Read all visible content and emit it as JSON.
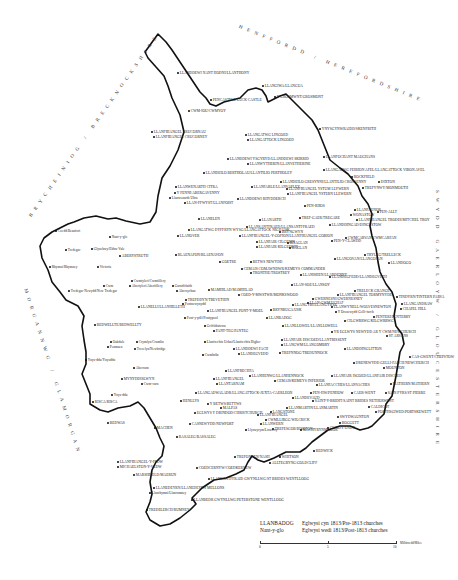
{
  "regions": {
    "brecknock": "BRYCHEINIOG / BRECKNOCKSHIRE",
    "hereford": "HENFFORDD / HEREFORDSHIRE",
    "gloucester": "SWYDD GAERLOYW / GLOUCESTERSHIRE",
    "glamorgan": "MORGANNWG / GLAMORGAN"
  },
  "places": [
    {
      "name": "LLANDDEWI NANT HODNI/LLANTHONY",
      "x": 176,
      "y": 71,
      "type": "pre"
    },
    {
      "name": "PENCASTELL/LUCK CASTLE",
      "x": 209,
      "y": 98,
      "type": "pre"
    },
    {
      "name": "CWM-IOU/CWMYOY",
      "x": 187,
      "y": 109,
      "type": "pre"
    },
    {
      "name": "LLANGIWA/LLANGUA",
      "x": 261,
      "y": 84,
      "type": "pre"
    },
    {
      "name": "Y GROSMWNT/GROSMONT",
      "x": 273,
      "y": 95,
      "type": "pre"
    },
    {
      "name": "LLANFIHANGEL CRUCORNAU",
      "x": 150,
      "y": 130,
      "type": "pre"
    },
    {
      "name": "LLANFIHANGEL CRUCORNEY",
      "x": 152,
      "y": 135,
      "type": "pre"
    },
    {
      "name": "LLANGATWG LINGOED",
      "x": 244,
      "y": 133,
      "type": "pre"
    },
    {
      "name": "LLANGATTOCK LINGOED",
      "x": 246,
      "y": 138,
      "type": "pre"
    },
    {
      "name": "YNYSGYNWRAIDD/SKENFRITH",
      "x": 318,
      "y": 127,
      "type": "pre"
    },
    {
      "name": "LLANDDEWI YSGYRYD/LLANDDEWI SKIRRID",
      "x": 226,
      "y": 157,
      "type": "pre"
    },
    {
      "name": "LLANWYTHERIN/LLANVETHERINE",
      "x": 246,
      "y": 162,
      "type": "pre"
    },
    {
      "name": "LLANFOCHANT MAUGHANS",
      "x": 322,
      "y": 155,
      "type": "pre"
    },
    {
      "name": "LLANDEILO BERTHOLAU/LLANTILIO PERTHOLEY",
      "x": 202,
      "y": 171,
      "type": "pre"
    },
    {
      "name": "LLANGATWG FEIBION AFEL/LLANGATTOCK VIBON AVEL",
      "x": 322,
      "y": 168,
      "type": "pre"
    },
    {
      "name": "LLANDEILO GRESYNNI/LLANTILIO CROSSENNY",
      "x": 279,
      "y": 180,
      "type": "pre"
    },
    {
      "name": "ROCKFIELD",
      "x": 350,
      "y": 175,
      "type": "pre"
    },
    {
      "name": "DIXTON",
      "x": 377,
      "y": 180,
      "type": "pre"
    },
    {
      "name": "LLANFABLE/LLANVAPLEY",
      "x": 250,
      "y": 185,
      "type": "pre"
    },
    {
      "name": "LLANFIHANGEL YSTUM LLYWERN",
      "x": 285,
      "y": 187,
      "type": "pre"
    },
    {
      "name": "LLANFIHANGEL YSTERN LLEWERN",
      "x": 286,
      "y": 192,
      "type": "pre"
    },
    {
      "name": "TREFYNWY/MONMOUTH",
      "x": 361,
      "y": 186,
      "type": "pre"
    },
    {
      "name": "LLANWENARTH CITRA",
      "x": 174,
      "y": 185,
      "type": "pre"
    },
    {
      "name": "Y FENNI/ABERGAVENNY",
      "x": 173,
      "y": 191,
      "type": "pre"
    },
    {
      "name": "Llanwenarth Ultra",
      "x": 168,
      "y": 196,
      "type": "post"
    },
    {
      "name": "LLANDDEWI RHYDDERCH",
      "x": 236,
      "y": 197,
      "type": "pre"
    },
    {
      "name": "LLAN-FFWYST/LLANFOIST",
      "x": 183,
      "y": 201,
      "type": "pre"
    },
    {
      "name": "PEN-RHOS",
      "x": 303,
      "y": 204,
      "type": "pre"
    },
    {
      "name": "LLANFAENOR",
      "x": 353,
      "y": 208,
      "type": "pre"
    },
    {
      "name": "WONASTOW",
      "x": 349,
      "y": 213,
      "type": "pre"
    },
    {
      "name": "PEN-ALLT",
      "x": 376,
      "y": 210,
      "type": "pre"
    },
    {
      "name": "LLANFIHANGEL TRODDI/MITCHEL TROY",
      "x": 355,
      "y": 218,
      "type": "pre"
    },
    {
      "name": "LLANDDINGAD/DINGESTOW",
      "x": 328,
      "y": 223,
      "type": "pre"
    },
    {
      "name": "LLANELEN",
      "x": 197,
      "y": 217,
      "type": "pre"
    },
    {
      "name": "LLANARTH",
      "x": 258,
      "y": 218,
      "type": "pre"
    },
    {
      "name": "TREF-GAER/TREGARE",
      "x": 298,
      "y": 216,
      "type": "pre"
    },
    {
      "name": "LLANGATWG DYFFRYN WYSG/LLANGATTOCK NIGH USK",
      "x": 187,
      "y": 228,
      "type": "pre"
    },
    {
      "name": "LLANSANTFRAED/LLANSANTFFRAED",
      "x": 245,
      "y": 225,
      "type": "pre"
    },
    {
      "name": "BRYNGWYN",
      "x": 278,
      "y": 230,
      "type": "pre"
    },
    {
      "name": "LLANFIHANGEL-Y-GOFION/LLANFIHANGEL GOBION",
      "x": 238,
      "y": 234,
      "type": "pre"
    },
    {
      "name": "LLANOVER",
      "x": 176,
      "y": 234,
      "type": "pre"
    },
    {
      "name": "Nant-y-glo",
      "x": 108,
      "y": 235,
      "type": "post"
    },
    {
      "name": "Coedd/Beaufort",
      "x": 54,
      "y": 229,
      "type": "post"
    },
    {
      "name": "LLANFAIR CILGEDIN",
      "x": 255,
      "y": 240,
      "type": "pre"
    },
    {
      "name": "LLANFAIR KILGEDDIN",
      "x": 255,
      "y": 245,
      "type": "pre"
    },
    {
      "name": "RHAGLAN",
      "x": 286,
      "y": 241,
      "type": "pre"
    },
    {
      "name": "RAGLAN",
      "x": 288,
      "y": 246,
      "type": "pre"
    },
    {
      "name": "PEN-Y-CLAWDD",
      "x": 330,
      "y": 239,
      "type": "pre"
    },
    {
      "name": "CWMCARVAN/CWMCARFAN",
      "x": 344,
      "y": 236,
      "type": "pre"
    },
    {
      "name": "Tredegar",
      "x": 64,
      "y": 248,
      "type": "post"
    },
    {
      "name": "Glynebwy/Ebbw Vale",
      "x": 90,
      "y": 247,
      "type": "post"
    },
    {
      "name": "ABERYSTRUTH",
      "x": 118,
      "y": 254,
      "type": "pre"
    },
    {
      "name": "BLAENAFON/BLAENAVON",
      "x": 174,
      "y": 253,
      "type": "pre"
    },
    {
      "name": "TRYLEG/TRELLECK",
      "x": 363,
      "y": 253,
      "type": "pre"
    },
    {
      "name": "LLANGOVAN/LLANGOFAN",
      "x": 333,
      "y": 257,
      "type": "pre"
    },
    {
      "name": "LLANDOGO",
      "x": 387,
      "y": 261,
      "type": "pre"
    },
    {
      "name": "Rhymni/Rhymney",
      "x": 48,
      "y": 265,
      "type": "post"
    },
    {
      "name": "Victoria",
      "x": 96,
      "y": 265,
      "type": "post"
    },
    {
      "name": "GOETRE",
      "x": 218,
      "y": 260,
      "type": "pre"
    },
    {
      "name": "BETWS NEWYDD",
      "x": 249,
      "y": 260,
      "type": "pre"
    },
    {
      "name": "CEMAIS COMAWNDWR/KEMEYS COMMANDER",
      "x": 240,
      "y": 267,
      "type": "pre"
    },
    {
      "name": "TRONTHE/TROSTREY",
      "x": 249,
      "y": 271,
      "type": "pre"
    },
    {
      "name": "LLANISHEN/LLANDENNY",
      "x": 299,
      "y": 273,
      "type": "pre"
    },
    {
      "name": "Cwmtyleri/Cwmtillery",
      "x": 130,
      "y": 279,
      "type": "post"
    },
    {
      "name": "Abertyleri/Abertillery",
      "x": 128,
      "y": 284,
      "type": "post"
    },
    {
      "name": "Garndiffaith",
      "x": 171,
      "y": 284,
      "type": "post"
    },
    {
      "name": "Abersychan",
      "x": 175,
      "y": 289,
      "type": "post"
    },
    {
      "name": "Cwm",
      "x": 102,
      "y": 284,
      "type": "post"
    },
    {
      "name": "Tredegar Newydd/New Tredegar",
      "x": 67,
      "y": 289,
      "type": "post"
    },
    {
      "name": "MAMHILAD/MAMHILAD",
      "x": 207,
      "y": 288,
      "type": "pre"
    },
    {
      "name": "COED-Y-MWSTWR/MONKSWOOD",
      "x": 237,
      "y": 293,
      "type": "pre"
    },
    {
      "name": "LLAN-SOE/LLANSOY",
      "x": 290,
      "y": 283,
      "type": "pre"
    },
    {
      "name": "LLANDEGFEDD/LLANDEGVETH",
      "x": 328,
      "y": 275,
      "type": "pre"
    },
    {
      "name": "TRELECK GRANGE",
      "x": 353,
      "y": 289,
      "type": "pre"
    },
    {
      "name": "LLANFIHANGEL TORMYNYDD",
      "x": 336,
      "y": 293,
      "type": "pre"
    },
    {
      "name": "TINDYRN/TINTERN PARVA",
      "x": 395,
      "y": 295,
      "type": "pre"
    },
    {
      "name": "GWERNESNI/GWERNESNEY",
      "x": 311,
      "y": 297,
      "type": "pre"
    },
    {
      "name": "LLANGANDRAW",
      "x": 400,
      "y": 302,
      "type": "pre"
    },
    {
      "name": "CHAPEL HILL",
      "x": 399,
      "y": 307,
      "type": "pre"
    },
    {
      "name": "TREFDDYN/TREVETHIN",
      "x": 184,
      "y": 298,
      "type": "pre"
    },
    {
      "name": "Pontnewynydd",
      "x": 181,
      "y": 302,
      "type": "post"
    },
    {
      "name": "LLANELLI/LLANHILLETH",
      "x": 137,
      "y": 305,
      "type": "pre"
    },
    {
      "name": "LLANGYBI/LLANGYBYE",
      "x": 291,
      "y": 303,
      "type": "pre"
    },
    {
      "name": "LLAN-GWM UCHAF",
      "x": 306,
      "y": 301,
      "type": "pre"
    },
    {
      "name": "LLANFIHANGEL PONT-Y-MOEL",
      "x": 206,
      "y": 309,
      "type": "pre"
    },
    {
      "name": "BRYNBUGA/USK",
      "x": 269,
      "y": 308,
      "type": "pre"
    },
    {
      "name": "LLANWYNELL/WOLVESNEWTON",
      "x": 330,
      "y": 305,
      "type": "pre"
    },
    {
      "name": "Y Drenewydd Gelli-farch",
      "x": 334,
      "y": 310,
      "type": "post"
    },
    {
      "name": "PENTERI/PENTERRY",
      "x": 372,
      "y": 315,
      "type": "pre"
    },
    {
      "name": "Pont-y-pŵl/Pontypool",
      "x": 183,
      "y": 316,
      "type": "post"
    },
    {
      "name": "LLANBADOG",
      "x": 265,
      "y": 316,
      "type": "pre"
    },
    {
      "name": "BEDWELLTE/BEDWELLTY",
      "x": 93,
      "y": 323,
      "type": "pre"
    },
    {
      "name": "Griffithstown",
      "x": 203,
      "y": 324,
      "type": "post"
    },
    {
      "name": "PANT-TEG/PANTEG",
      "x": 212,
      "y": 329,
      "type": "pre"
    },
    {
      "name": "LLANLLOWEL/LLANLLOWELL",
      "x": 281,
      "y": 324,
      "type": "pre"
    },
    {
      "name": "CILGWRRWG/KILGWRRWG",
      "x": 343,
      "y": 319,
      "type": "pre"
    },
    {
      "name": "YR EGLWYS NEWYDD AR Y CWM/NEWCHURCH",
      "x": 330,
      "y": 330,
      "type": "pre"
    },
    {
      "name": "ST ARVANS",
      "x": 385,
      "y": 334,
      "type": "pre"
    },
    {
      "name": "LLANFAIR DISCOED/LLANTRISSENT",
      "x": 280,
      "y": 338,
      "type": "pre"
    },
    {
      "name": "LLANGWM/LLANGOMBRY",
      "x": 280,
      "y": 343,
      "type": "pre"
    },
    {
      "name": "Oakdale",
      "x": 109,
      "y": 340,
      "type": "post"
    },
    {
      "name": "Penmaen",
      "x": 106,
      "y": 345,
      "type": "post"
    },
    {
      "name": "Crymlyn/Crumlin",
      "x": 135,
      "y": 340,
      "type": "post"
    },
    {
      "name": "Trecelyn/Newbridge",
      "x": 133,
      "y": 347,
      "type": "post"
    },
    {
      "name": "Llanfrechfa Uchaf/Llanfrechfa Higher",
      "x": 203,
      "y": 340,
      "type": "post"
    },
    {
      "name": "LLANDDEWI FACH",
      "x": 232,
      "y": 347,
      "type": "pre"
    },
    {
      "name": "LLANDEGVEDD",
      "x": 237,
      "y": 352,
      "type": "pre"
    },
    {
      "name": "TREFNNOG/TREDUNNOCK",
      "x": 278,
      "y": 351,
      "type": "pre"
    },
    {
      "name": "LLANDDINGLITTON",
      "x": 343,
      "y": 347,
      "type": "pre"
    },
    {
      "name": "CAS-GWENT/CHEPSTOW",
      "x": 408,
      "y": 355,
      "type": "pre"
    },
    {
      "name": "Ynys-ddu/Ynysddu",
      "x": 84,
      "y": 358,
      "type": "post"
    },
    {
      "name": "Cwmbrân",
      "x": 201,
      "y": 353,
      "type": "post"
    },
    {
      "name": "DRENEWYDD GELLI-FARCH/NEWCHURCH",
      "x": 352,
      "y": 361,
      "type": "pre"
    },
    {
      "name": "MOUNTON",
      "x": 382,
      "y": 366,
      "type": "pre"
    },
    {
      "name": "Abercarn",
      "x": 132,
      "y": 366,
      "type": "post"
    },
    {
      "name": "LLANFRECHFA",
      "x": 224,
      "y": 369,
      "type": "pre"
    },
    {
      "name": "LLANHENWG/LLANHENNOCK",
      "x": 248,
      "y": 374,
      "type": "pre"
    },
    {
      "name": "LLANFAIR ISGOED/LLANFAIR DISCOED",
      "x": 330,
      "y": 374,
      "type": "pre"
    },
    {
      "name": "MATHERN/MATHERN",
      "x": 389,
      "y": 382,
      "type": "pre"
    },
    {
      "name": "MYNYDDISLWYN",
      "x": 120,
      "y": 377,
      "type": "pre"
    },
    {
      "name": "Cwm-carn",
      "x": 140,
      "y": 382,
      "type": "post"
    },
    {
      "name": "LLANFIHANGEL",
      "x": 212,
      "y": 377,
      "type": "pre"
    },
    {
      "name": "LLANTARNAM",
      "x": 215,
      "y": 382,
      "type": "pre"
    },
    {
      "name": "CEMAIS/KEMEYS INFERIOR",
      "x": 273,
      "y": 379,
      "type": "pre"
    },
    {
      "name": "LLANFACCHES/LLANVACHES",
      "x": 315,
      "y": 383,
      "type": "pre"
    },
    {
      "name": "PEN-HW/PENHOW",
      "x": 309,
      "y": 391,
      "type": "pre"
    },
    {
      "name": "CAER-WENT",
      "x": 350,
      "y": 391,
      "type": "pre"
    },
    {
      "name": "SAIN PYRS/ST PIERRE",
      "x": 384,
      "y": 391,
      "type": "pre"
    },
    {
      "name": "Ynys-ddu",
      "x": 110,
      "y": 393,
      "type": "post"
    },
    {
      "name": "LLANGADWALADR/LLANGATTOCK-JUXTA-CAERLEON",
      "x": 194,
      "y": 391,
      "type": "pre"
    },
    {
      "name": "LLANDEVAUD",
      "x": 291,
      "y": 396,
      "type": "pre"
    },
    {
      "name": "SAINT-Y-BRIDIT/SAINT BRIDES NETHERWENT",
      "x": 311,
      "y": 399,
      "type": "pre"
    },
    {
      "name": "RISCA/RISCA",
      "x": 91,
      "y": 400,
      "type": "pre"
    },
    {
      "name": "HENLLYS",
      "x": 179,
      "y": 399,
      "type": "pre"
    },
    {
      "name": "Y BETWS/BETTWS",
      "x": 206,
      "y": 402,
      "type": "pre"
    },
    {
      "name": "MALPAS",
      "x": 219,
      "y": 406,
      "type": "pre"
    },
    {
      "name": "LLANMARTIN/LLANMARTIN",
      "x": 285,
      "y": 406,
      "type": "pre"
    },
    {
      "name": "CALDICOT",
      "x": 367,
      "y": 405,
      "type": "pre"
    },
    {
      "name": "PORTHSGIWED/PORTSKEWETT",
      "x": 374,
      "y": 410,
      "type": "pre"
    },
    {
      "name": "EGLWYS Y DRINDOD/CHRISTCHURCH",
      "x": 193,
      "y": 411,
      "type": "pre"
    },
    {
      "name": "LANGSTONE",
      "x": 269,
      "y": 410,
      "type": "pre"
    },
    {
      "name": "LLANFIHANGEL",
      "x": 256,
      "y": 413,
      "type": "pre"
    },
    {
      "name": "CWMLLIRGG/WILCRICK",
      "x": 264,
      "y": 418,
      "type": "pre"
    },
    {
      "name": "SWYDWAUNTON",
      "x": 336,
      "y": 415,
      "type": "pre"
    },
    {
      "name": "BOGGETT",
      "x": 338,
      "y": 421,
      "type": "pre"
    },
    {
      "name": "CWNDY/UNDY",
      "x": 326,
      "y": 426,
      "type": "pre"
    },
    {
      "name": "BEDWAS",
      "x": 106,
      "y": 421,
      "type": "pre"
    },
    {
      "name": "MACHEN",
      "x": 153,
      "y": 426,
      "type": "pre"
    },
    {
      "name": "CASNEWYDD/NEWPORT",
      "x": 188,
      "y": 422,
      "type": "pre"
    },
    {
      "name": "LLANWERN",
      "x": 259,
      "y": 422,
      "type": "pre"
    },
    {
      "name": "Llyswyrym/Liswerry",
      "x": 244,
      "y": 428,
      "type": "post"
    },
    {
      "name": "TREFESGOB/BISHTON",
      "x": 271,
      "y": 427,
      "type": "pre"
    },
    {
      "name": "MACHYRYNMAGOR",
      "x": 299,
      "y": 428,
      "type": "pre"
    },
    {
      "name": "BASALEG/BASSALEG",
      "x": 175,
      "y": 435,
      "type": "pre"
    },
    {
      "name": "REDWICK",
      "x": 312,
      "y": 449,
      "type": "pre"
    },
    {
      "name": "TREFONNEN/NASH",
      "x": 233,
      "y": 455,
      "type": "pre"
    },
    {
      "name": "WHITSON",
      "x": 278,
      "y": 455,
      "type": "pre"
    },
    {
      "name": "ALLTEGRYNG/GOLDCLIFF",
      "x": 268,
      "y": 461,
      "type": "pre"
    },
    {
      "name": "LLANFIHANGEL-Y-FEDW",
      "x": 116,
      "y": 460,
      "type": "pre"
    },
    {
      "name": "MICHAELSTON-Y-VEDW",
      "x": 116,
      "y": 465,
      "type": "pre"
    },
    {
      "name": "COEDCERNYW/COEDKERNEW",
      "x": 195,
      "y": 466,
      "type": "pre"
    },
    {
      "name": "MARSHFIELD/MAERUN",
      "x": 132,
      "y": 473,
      "type": "pre"
    },
    {
      "name": "LLANSANTFFRAID GWYNLLWG/ST BRIDES WENTLLOOG",
      "x": 207,
      "y": 477,
      "type": "pre"
    },
    {
      "name": "LLANEDEYRN/LLANEDEYRN MELLONS",
      "x": 152,
      "y": 486,
      "type": "pre"
    },
    {
      "name": "Llanrhymni/Llanrumney",
      "x": 148,
      "y": 491,
      "type": "post"
    },
    {
      "name": "LLANBEDR GWYNLLWG/PETERSTONE WENTLLOOG",
      "x": 190,
      "y": 498,
      "type": "pre"
    },
    {
      "name": "TREDELERCH/RUMNEY",
      "x": 145,
      "y": 508,
      "type": "pre"
    }
  ],
  "legend": {
    "pre_sample": "LLANBADOG",
    "pre_label": "Eglwysi cyn 1813/Pre-1813 churches",
    "post_sample": "Nant-y-glo",
    "post_label": "Eglwysi wedi 1813/Post-1813 churches"
  },
  "scale": {
    "ticks": [
      "0",
      "5",
      "10"
    ],
    "unit": "Milltiroedd/Miles"
  }
}
